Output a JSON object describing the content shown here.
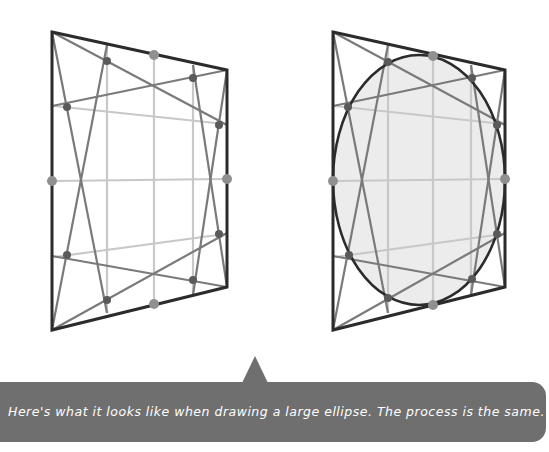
{
  "colors": {
    "frame": "#2b2b2b",
    "diagonal": "#7a7a7a",
    "grid": "#c8c8c8",
    "dot_dark": "#5a5a5a",
    "dot_mid": "#909090",
    "ellipse_stroke": "#2b2b2b",
    "ellipse_fill": "#ececec",
    "callout_bg": "#6f6f6f",
    "callout_text": "#ffffff"
  },
  "figures": [
    {
      "name": "perspective-square-construction",
      "has_ellipse": false
    },
    {
      "name": "perspective-square-with-ellipse",
      "has_ellipse": true
    }
  ],
  "callout": {
    "text": "Here's what it looks like when drawing a large ellipse. The process is the same."
  }
}
